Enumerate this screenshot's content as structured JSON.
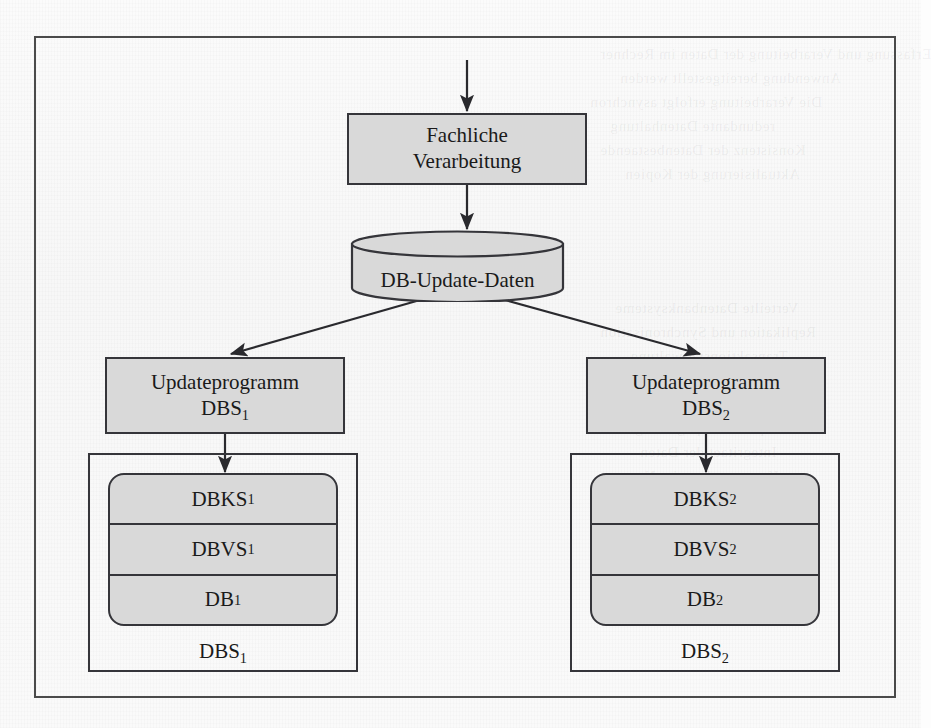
{
  "figure": {
    "colors": {
      "shaded_fill": "#d9d9d9",
      "stroke": "#35353a",
      "frame": "#4a4a4a",
      "text": "#1a1a1a",
      "page": "#fdfdfd"
    }
  },
  "nodes": {
    "process": {
      "line1": "Fachliche",
      "line2": "Verarbeitung"
    },
    "datastore": {
      "label": "DB-Update-Daten"
    },
    "update_left": {
      "line1": "Updateprogramm",
      "line2_base": "DBS",
      "line2_sub": "1"
    },
    "update_right": {
      "line1": "Updateprogramm",
      "line2_base": "DBS",
      "line2_sub": "2"
    },
    "system_left": {
      "caption_base": "DBS",
      "caption_sub": "1",
      "layers": [
        {
          "base": "DBKS",
          "sub": "1"
        },
        {
          "base": "DBVS",
          "sub": "1"
        },
        {
          "base": "DB",
          "sub": "1"
        }
      ]
    },
    "system_right": {
      "caption_base": "DBS",
      "caption_sub": "2",
      "layers": [
        {
          "base": "DBKS",
          "sub": "2"
        },
        {
          "base": "DBVS",
          "sub": "2"
        },
        {
          "base": "DB",
          "sub": "2"
        }
      ]
    }
  },
  "connectors": [
    {
      "name": "input-to-process",
      "from": "external-input",
      "to": "process"
    },
    {
      "name": "process-to-datastore",
      "from": "process",
      "to": "datastore"
    },
    {
      "name": "datastore-to-update-left",
      "from": "datastore",
      "to": "update_left"
    },
    {
      "name": "datastore-to-update-right",
      "from": "datastore",
      "to": "update_right"
    },
    {
      "name": "update-left-to-system",
      "from": "update_left",
      "to": "system_left"
    },
    {
      "name": "update-right-to-system",
      "from": "update_right",
      "to": "system_right"
    }
  ],
  "background_bleed": [
    {
      "text": "Erfassung und Verarbeitung der Daten im Rechner",
      "x": 600,
      "y": 46
    },
    {
      "text": "Anwendung bereitgestellt werden",
      "x": 620,
      "y": 70
    },
    {
      "text": "Die Verarbeitung erfolgt asynchron",
      "x": 590,
      "y": 94
    },
    {
      "text": "redundante Datenhaltung",
      "x": 610,
      "y": 118
    },
    {
      "text": "Konsistenz der Datenbestaende",
      "x": 600,
      "y": 142
    },
    {
      "text": "Aktualisierung der Kopien",
      "x": 625,
      "y": 166
    },
    {
      "text": "Verteilte Datenbanksysteme",
      "x": 615,
      "y": 300
    },
    {
      "text": "Replikation und Synchronisation",
      "x": 600,
      "y": 324
    },
    {
      "text": "Transaktionsverwaltung",
      "x": 630,
      "y": 348
    },
    {
      "text": "Zweiphasen-Commit-Protokoll",
      "x": 605,
      "y": 372
    },
    {
      "text": "Lokale Datenbankkopien",
      "x": 628,
      "y": 396
    },
    {
      "text": "Update-Propagierung",
      "x": 635,
      "y": 420
    },
    {
      "text": "Integritaet der Daten",
      "x": 640,
      "y": 444
    },
    {
      "text": "Knotenrechner im Netz",
      "x": 625,
      "y": 468
    },
    {
      "text": "Sperrverfahren",
      "x": 660,
      "y": 492
    },
    {
      "text": "Recovery-Massnahmen",
      "x": 630,
      "y": 516
    }
  ]
}
